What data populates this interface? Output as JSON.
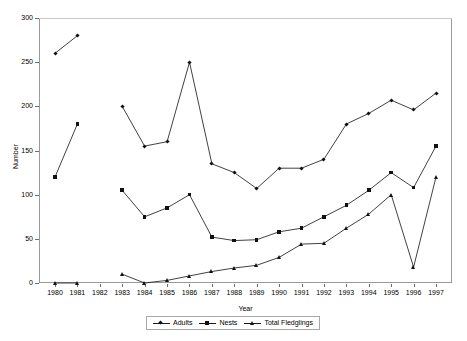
{
  "chart_data": {
    "type": "line",
    "title": "",
    "xlabel": "Year",
    "ylabel": "Number",
    "x": [
      1980,
      1981,
      1982,
      1983,
      1984,
      1985,
      1986,
      1987,
      1988,
      1989,
      1990,
      1991,
      1992,
      1993,
      1994,
      1995,
      1996,
      1997
    ],
    "xtick_labels": [
      "1980",
      "1981",
      "1982",
      "1983",
      "1984",
      "1985",
      "1986",
      "1987",
      "1988",
      "1989",
      "1990",
      "1991",
      "1992",
      "1993",
      "1994",
      "1995",
      "1996",
      "1997"
    ],
    "ytick_labels": [
      "0",
      "50",
      "100",
      "150",
      "200",
      "250",
      "300"
    ],
    "ytick_values": [
      0,
      50,
      100,
      150,
      200,
      250,
      300
    ],
    "ylim": [
      0,
      300
    ],
    "xlim": [
      1980,
      1997
    ],
    "grid": "top-border-only",
    "legend_position": "bottom-center",
    "series": [
      {
        "name": "Adults",
        "marker": "diamond",
        "color": "#111111",
        "values": [
          260,
          280,
          null,
          200,
          155,
          160,
          250,
          135,
          125,
          107,
          130,
          130,
          140,
          180,
          192,
          207,
          196,
          215
        ]
      },
      {
        "name": "Nests",
        "marker": "square",
        "color": "#111111",
        "values": [
          120,
          180,
          null,
          105,
          75,
          85,
          100,
          52,
          48,
          49,
          58,
          62,
          75,
          88,
          105,
          125,
          108,
          155
        ]
      },
      {
        "name": "Total Fledglings",
        "marker": "triangle",
        "color": "#111111",
        "values": [
          0,
          0,
          null,
          10,
          0,
          3,
          8,
          13,
          17,
          20,
          29,
          44,
          45,
          62,
          78,
          100,
          18,
          120
        ]
      }
    ]
  },
  "legend": {
    "entries": [
      {
        "label": "Adults"
      },
      {
        "label": "Nests"
      },
      {
        "label": "Total Fledglings"
      }
    ]
  }
}
